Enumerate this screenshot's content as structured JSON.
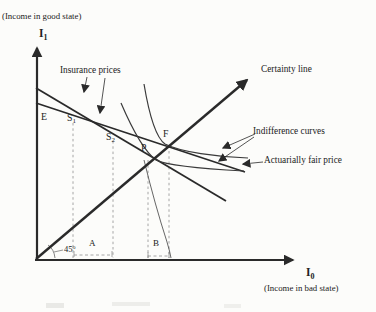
{
  "colors": {
    "ink": "#222222",
    "line": "#2a2a2a",
    "curve": "#3a3a3a",
    "guide": "#8f8f8f",
    "smudge": "#e9e9e6",
    "background": "#fcfcfa"
  },
  "axes": {
    "y": {
      "symbol": "I",
      "subscript": "1",
      "caption": "(Income in good state)"
    },
    "x": {
      "symbol": "I",
      "subscript": "0",
      "caption": "(Income in bad state)"
    }
  },
  "labels": {
    "certainty_line": "Certainty line",
    "insurance_prices": "Insurance prices",
    "indifference_curves": "Indifference curves",
    "actuarially_fair_price": "Actuarially fair price"
  },
  "angle": {
    "value": "45",
    "degree_mark": "o"
  },
  "points": {
    "E": "E",
    "S1": {
      "base": "S",
      "sub": "1"
    },
    "S2": {
      "base": "S",
      "sub": "2"
    },
    "P": "P",
    "F": "F"
  },
  "segments": {
    "A": "A",
    "B": "B"
  }
}
